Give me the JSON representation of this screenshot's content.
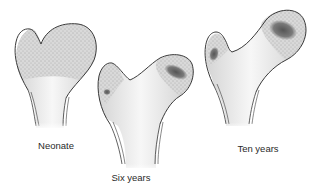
{
  "figure": {
    "stages": [
      {
        "label": "Neonate",
        "ossification_centers": 0
      },
      {
        "label": "Six years",
        "ossification_centers": 2
      },
      {
        "label": "Ten years",
        "ossification_centers": 2
      }
    ],
    "colors": {
      "outline": "#3a3a3a",
      "cartilage_stipple": "#8a8a8a",
      "bone_shaft": "#e6e6e6",
      "ossification": "#6e6e6e"
    }
  }
}
